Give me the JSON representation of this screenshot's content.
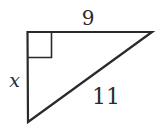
{
  "figure": {
    "type": "right-triangle",
    "labels": {
      "top_side": "9",
      "left_side": "x",
      "hypotenuse": "11"
    },
    "vertices": {
      "right_angle": [
        27.5,
        32
      ],
      "top_right": [
        152,
        32
      ],
      "bottom": [
        28,
        122
      ]
    },
    "right_angle_marker_size": 24,
    "stroke_color": "#2a2a2a",
    "background_color": "#ffffff"
  }
}
